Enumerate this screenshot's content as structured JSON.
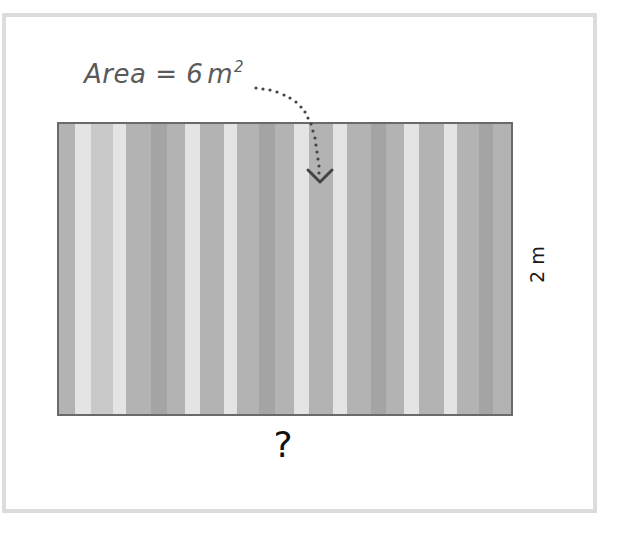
{
  "diagram": {
    "area_label": {
      "prefix": "Area = 6",
      "unit": "m",
      "exponent": "2",
      "dots": "....."
    },
    "height_label": "2 m",
    "width_label": "?",
    "colors": {
      "frame": "#dcdcdc",
      "rect_border": "#6a6a6a",
      "base_stripe": "#b3b3b3",
      "light_stripe": "#e4e4e4",
      "mid_light_stripe": "#c9c9c9",
      "dark_stripe": "#a4a4a4",
      "annotation_text": "#5a5a5a",
      "arrow": "#444444"
    },
    "stripes": [
      {
        "x": 16,
        "w": 16,
        "tone": "light"
      },
      {
        "x": 32,
        "w": 22,
        "tone": "mid"
      },
      {
        "x": 54,
        "w": 13,
        "tone": "light"
      },
      {
        "x": 92,
        "w": 16,
        "tone": "dark"
      },
      {
        "x": 126,
        "w": 15,
        "tone": "light"
      },
      {
        "x": 165,
        "w": 13,
        "tone": "light"
      },
      {
        "x": 200,
        "w": 16,
        "tone": "dark"
      },
      {
        "x": 235,
        "w": 15,
        "tone": "light"
      },
      {
        "x": 274,
        "w": 14,
        "tone": "light"
      },
      {
        "x": 312,
        "w": 15,
        "tone": "dark"
      },
      {
        "x": 345,
        "w": 15,
        "tone": "light"
      },
      {
        "x": 385,
        "w": 13,
        "tone": "light"
      },
      {
        "x": 420,
        "w": 14,
        "tone": "dark"
      }
    ]
  }
}
